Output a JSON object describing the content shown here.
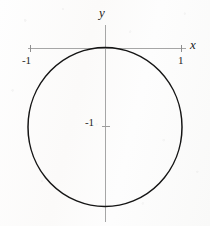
{
  "figure": {
    "background_color": "#fdfdfc",
    "ink_color": "#151515",
    "axis_color": "#9a9a9a"
  },
  "axes": {
    "x_axis_label": "x",
    "y_axis_label": "y",
    "x_axis": {
      "y_pixel": 48,
      "x_start": 28,
      "x_end": 186
    },
    "y_axis": {
      "x_pixel": 105,
      "y_start": 25,
      "y_end": 222
    }
  },
  "ticks": [
    {
      "name": "x-neg-one",
      "label": "-1",
      "axis": "x",
      "value": -1,
      "x_pixel": 30,
      "y_pixel": 48
    },
    {
      "name": "x-pos-one",
      "label": "1",
      "axis": "x",
      "value": 1,
      "x_pixel": 181,
      "y_pixel": 48
    },
    {
      "name": "y-neg-one",
      "label": "-1",
      "axis": "y",
      "value": -1,
      "x_pixel": 105,
      "y_pixel": 127
    }
  ],
  "chart_data": {
    "type": "line",
    "xlabel": "x",
    "ylabel": "y",
    "xlim": [
      -1.5,
      1.5
    ],
    "ylim": [
      -2.3,
      0.3
    ],
    "grid": false,
    "legend": null,
    "xticks": [
      -1,
      1
    ],
    "xticklabels": [
      "-1",
      "1"
    ],
    "yticks": [
      -1
    ],
    "yticklabels": [
      "-1"
    ],
    "series": [
      {
        "name": "circle",
        "shape": "circle",
        "equation": "x^2 + (y + 1)^2 = 1",
        "center": [
          0,
          -1
        ],
        "radius": 1,
        "closed": true,
        "stroke": "#151515",
        "stroke_width": 1.4,
        "fill": "none",
        "pixel_center": [
          105,
          127
        ],
        "pixel_radius_x": 77,
        "pixel_radius_y": 79.5
      }
    ],
    "annotations": [
      {
        "text": "y",
        "x_pixel": 104,
        "y_pixel": 13,
        "italic": true
      },
      {
        "text": "x",
        "x_pixel": 194,
        "y_pixel": 44,
        "italic": true
      },
      {
        "text": "-1",
        "x_pixel": 27,
        "y_pixel": 60,
        "italic": false
      },
      {
        "text": "1",
        "x_pixel": 180,
        "y_pixel": 60,
        "italic": false
      },
      {
        "text": "-1",
        "x_pixel": 91,
        "y_pixel": 123,
        "italic": false
      }
    ]
  }
}
